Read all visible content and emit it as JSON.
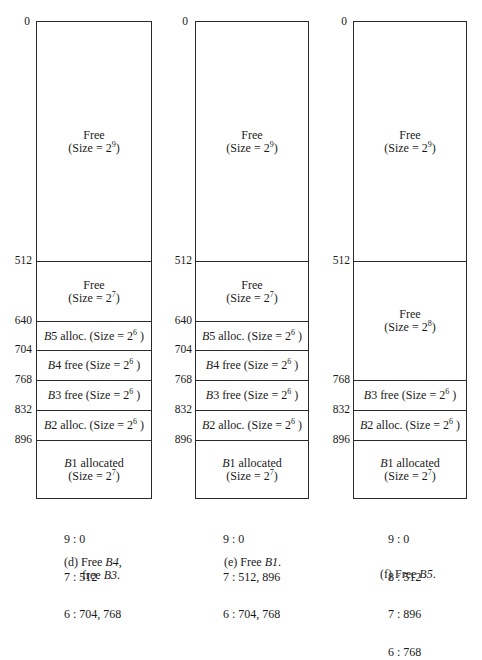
{
  "panels": [
    {
      "id": "d",
      "caption_line1": "(d) Free ",
      "caption_italic1": "B4",
      "caption_after1": ",",
      "caption_line2": "free ",
      "caption_italic2": "B3",
      "caption_after2": ".",
      "addresses": [
        "0",
        "512",
        "640",
        "704",
        "768",
        "832",
        "896"
      ],
      "blocks": [
        {
          "label_prefix": "",
          "label_italic": "",
          "label": "Free",
          "size_text": "(Size = 2",
          "exp": "9",
          "size_close": ")",
          "two_line": true,
          "start": 0,
          "end": 512
        },
        {
          "label_prefix": "",
          "label_italic": "",
          "label": "Free",
          "size_text": "(Size = 2",
          "exp": "7",
          "size_close": ")",
          "two_line": true,
          "start": 512,
          "end": 640
        },
        {
          "label_italic": "B",
          "label": "5 alloc. ",
          "size_text": "(Size = 2",
          "exp": "6",
          "size_close": " )",
          "two_line": false,
          "start": 640,
          "end": 704
        },
        {
          "label_italic": "B",
          "label": "4 free ",
          "size_text": "(Size = 2",
          "exp": "6",
          "size_close": " )",
          "two_line": false,
          "start": 704,
          "end": 768
        },
        {
          "label_italic": "B",
          "label": "3 free ",
          "size_text": "(Size = 2",
          "exp": "6",
          "size_close": " )",
          "two_line": false,
          "start": 768,
          "end": 832
        },
        {
          "label_italic": "B",
          "label": "2 alloc. ",
          "size_text": "(Size = 2",
          "exp": "6",
          "size_close": " )",
          "two_line": false,
          "start": 832,
          "end": 896
        },
        {
          "label_italic": "B",
          "label": "1 allocated",
          "size_text": "(Size = 2",
          "exp": "7",
          "size_close": ")",
          "two_line": true,
          "start": 896,
          "end": 1024
        }
      ],
      "free_list": [
        "9 : 0",
        "7 : 512",
        "6 : 704, 768"
      ]
    },
    {
      "id": "e",
      "caption_line1": "(e) Free ",
      "caption_italic1": "B1",
      "caption_after1": ".",
      "addresses": [
        "0",
        "512",
        "640",
        "704",
        "768",
        "832",
        "896"
      ],
      "blocks": [
        {
          "label": "Free",
          "size_text": "(Size = 2",
          "exp": "9",
          "size_close": ")",
          "two_line": true,
          "start": 0,
          "end": 512
        },
        {
          "label": "Free",
          "size_text": "(Size = 2",
          "exp": "7",
          "size_close": ")",
          "two_line": true,
          "start": 512,
          "end": 640
        },
        {
          "label_italic": "B",
          "label": "5 alloc. ",
          "size_text": "(Size = 2",
          "exp": "6",
          "size_close": " )",
          "two_line": false,
          "start": 640,
          "end": 704
        },
        {
          "label_italic": "B",
          "label": "4 free ",
          "size_text": "(Size = 2",
          "exp": "6",
          "size_close": " )",
          "two_line": false,
          "start": 704,
          "end": 768
        },
        {
          "label_italic": "B",
          "label": "3 free ",
          "size_text": "(Size = 2",
          "exp": "6",
          "size_close": " )",
          "two_line": false,
          "start": 768,
          "end": 832
        },
        {
          "label_italic": "B",
          "label": "2 alloc. ",
          "size_text": "(Size = 2",
          "exp": "6",
          "size_close": " )",
          "two_line": false,
          "start": 832,
          "end": 896
        },
        {
          "label_italic": "B",
          "label": "1 allocated",
          "size_text": "(Size = 2",
          "exp": "7",
          "size_close": ")",
          "two_line": true,
          "start": 896,
          "end": 1024
        }
      ],
      "free_list": [
        "9 : 0",
        "7 : 512, 896",
        "6 : 704, 768"
      ]
    },
    {
      "id": "f",
      "caption_line1": "(f) Free ",
      "caption_italic1": "B5",
      "caption_after1": ".",
      "addresses": [
        "0",
        "512",
        "768",
        "832",
        "896"
      ],
      "blocks": [
        {
          "label": "Free",
          "size_text": "(Size = 2",
          "exp": "9",
          "size_close": ")",
          "two_line": true,
          "start": 0,
          "end": 512
        },
        {
          "label": "Free",
          "size_text": "(Size = 2",
          "exp": "8",
          "size_close": ")",
          "two_line": true,
          "start": 512,
          "end": 768
        },
        {
          "label_italic": "B",
          "label": "3 free ",
          "size_text": "(Size = 2",
          "exp": "6",
          "size_close": " )",
          "two_line": false,
          "start": 768,
          "end": 832
        },
        {
          "label_italic": "B",
          "label": "2 alloc. ",
          "size_text": "(Size = 2",
          "exp": "6",
          "size_close": " )",
          "two_line": false,
          "start": 832,
          "end": 896
        },
        {
          "label_italic": "B",
          "label": "1 allocated",
          "size_text": "(Size = 2",
          "exp": "7",
          "size_close": ")",
          "two_line": true,
          "start": 896,
          "end": 1024
        }
      ],
      "free_list": [
        "9 : 0",
        "8 : 512",
        "7 : 896",
        "6 : 768"
      ]
    }
  ]
}
